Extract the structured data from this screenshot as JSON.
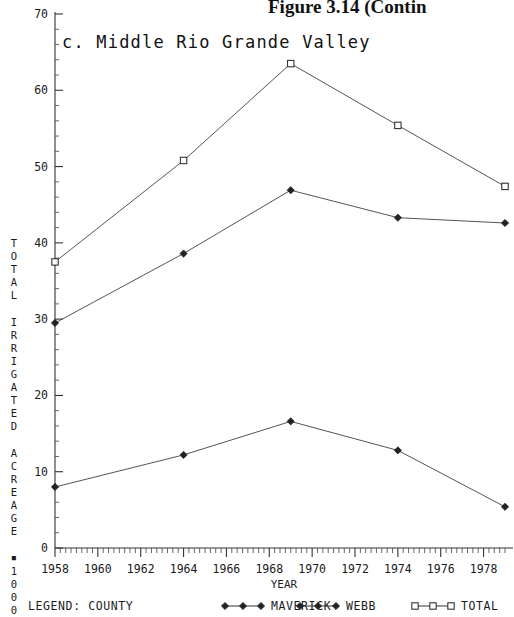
{
  "figure": {
    "caption": "Figure 3.14 (Contin",
    "subtitle": "c. Middle Rio Grande Valley"
  },
  "axes": {
    "y_label_chars": [
      "T",
      "O",
      "T",
      "A",
      "L",
      "",
      "I",
      "R",
      "R",
      "I",
      "G",
      "A",
      "T",
      "E",
      "D",
      "",
      "A",
      "C",
      "R",
      "E",
      "A",
      "G",
      "E",
      "",
      "▪",
      "1",
      "0",
      "0",
      "0"
    ],
    "y_label_text": "TOTAL IRRIGATED ACREAGE ▪ 1000",
    "x_label": "YEAR",
    "y_ticks": [
      "0",
      "10",
      "20",
      "30",
      "40",
      "50",
      "60",
      "70"
    ],
    "x_ticks": [
      "1958",
      "1960",
      "1962",
      "1964",
      "1966",
      "1968",
      "1970",
      "1972",
      "1974",
      "1976",
      "1978"
    ]
  },
  "legend": {
    "prefix": "LEGEND: COUNTY",
    "entries": [
      {
        "label": "MAVERICK",
        "marker": "filled-diamond",
        "color": "#222222"
      },
      {
        "label": "WEBB",
        "marker": "filled-diamond",
        "color": "#222222"
      },
      {
        "label": "TOTAL",
        "marker": "open-square",
        "color": "#222222"
      }
    ]
  },
  "chart_data": {
    "type": "line",
    "title": "c. Middle Rio Grande Valley",
    "xlabel": "YEAR",
    "ylabel": "TOTAL IRRIGATED ACREAGE ▪ 1000",
    "xlim": [
      1958,
      1979
    ],
    "ylim": [
      0,
      70
    ],
    "grid": false,
    "legend_position": "bottom",
    "x": [
      1958,
      1964,
      1969,
      1974,
      1979
    ],
    "series": [
      {
        "name": "TOTAL",
        "marker": "open-square",
        "values": [
          37.5,
          50.8,
          63.5,
          55.4,
          47.4
        ]
      },
      {
        "name": "MAVERICK",
        "marker": "filled-diamond",
        "values": [
          29.5,
          38.6,
          46.9,
          43.3,
          42.6
        ]
      },
      {
        "name": "WEBB",
        "marker": "filled-diamond",
        "values": [
          8.0,
          12.2,
          16.6,
          12.8,
          5.4
        ]
      }
    ]
  }
}
